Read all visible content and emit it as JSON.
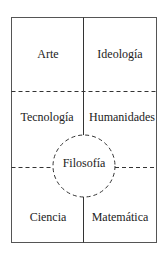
{
  "diagram": {
    "cells": {
      "top_left": "Arte",
      "top_right": "Ideología",
      "middle_left": "Tecnología",
      "middle_right": "Humanidades",
      "bottom_left": "Ciencia",
      "bottom_right": "Matemática"
    },
    "center": "Filosofía",
    "colors": {
      "line": "#333333",
      "text": "#222222",
      "background": "#ffffff"
    }
  }
}
